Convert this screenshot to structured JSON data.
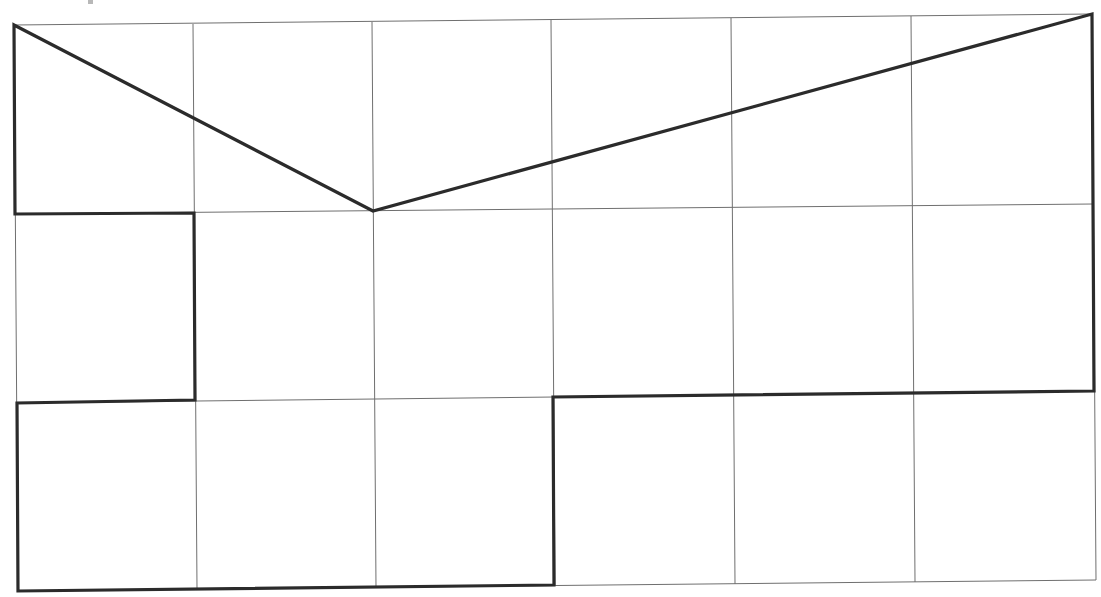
{
  "diagram": {
    "type": "grid-polygon",
    "grid": {
      "columns": 6,
      "rows": 3,
      "color": "#6f6f6f",
      "vertical_lines": [
        {
          "x1": 14,
          "y1": 25,
          "x2": 18,
          "y2": 591
        },
        {
          "x1": 193,
          "y1": 24,
          "x2": 197,
          "y2": 589
        },
        {
          "x1": 372,
          "y1": 22,
          "x2": 376,
          "y2": 588
        },
        {
          "x1": 551,
          "y1": 20,
          "x2": 555,
          "y2": 586
        },
        {
          "x1": 731,
          "y1": 18,
          "x2": 735,
          "y2": 584
        },
        {
          "x1": 911,
          "y1": 16,
          "x2": 915,
          "y2": 582
        },
        {
          "x1": 1092,
          "y1": 14,
          "x2": 1096,
          "y2": 580
        }
      ],
      "horizontal_lines": [
        {
          "x1": 14,
          "y1": 25,
          "x2": 1092,
          "y2": 14
        },
        {
          "x1": 15,
          "y1": 214,
          "x2": 1093,
          "y2": 204
        },
        {
          "x1": 17,
          "y1": 403,
          "x2": 1095,
          "y2": 391
        },
        {
          "x1": 18,
          "y1": 591,
          "x2": 1096,
          "y2": 580
        }
      ]
    },
    "polygon": {
      "color": "#2b2b2b",
      "stroke_width": 3.2,
      "points": [
        [
          14,
          25
        ],
        [
          373,
          211
        ],
        [
          1092,
          14
        ],
        [
          1094,
          391
        ],
        [
          553,
          397
        ],
        [
          554,
          585
        ],
        [
          18,
          591
        ],
        [
          17,
          403
        ],
        [
          195,
          400
        ],
        [
          194,
          213
        ],
        [
          15,
          214
        ]
      ]
    },
    "labels": []
  }
}
